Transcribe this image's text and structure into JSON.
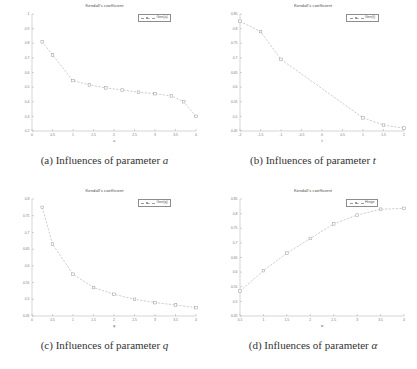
{
  "figure": {
    "panels": [
      {
        "id": "a",
        "caption_prefix": "(a) Influences of parameter",
        "caption_param": "a",
        "title": "Kendall's coefficient",
        "legend_label": "Gen(a)"
      },
      {
        "id": "b",
        "caption_prefix": "(b) Influences of parameter",
        "caption_param": "t",
        "title": "Kendall's coefficient",
        "legend_label": "Gen(t)"
      },
      {
        "id": "c",
        "caption_prefix": "(c) Influences of parameter",
        "caption_param": "q",
        "title": "Kendall's coefficient",
        "legend_label": "Gen(q)"
      },
      {
        "id": "d",
        "caption_prefix": "(d) Influences of parameter",
        "caption_param": "α",
        "title": "Kendall's coefficient",
        "legend_label": "Hinge"
      }
    ]
  },
  "chart_data": [
    {
      "type": "line",
      "panel": "a",
      "title": "Kendall's coefficient",
      "xlabel": "a",
      "ylabel": "",
      "legend": [
        "Gen(a)"
      ],
      "legend_position": "top-right",
      "grid": false,
      "xlim": [
        0,
        4
      ],
      "ylim": [
        0.2,
        1.0
      ],
      "xticks": [
        0,
        0.5,
        1,
        1.5,
        2,
        2.5,
        3,
        3.5,
        4
      ],
      "yticks": [
        0.2,
        0.3,
        0.4,
        0.5,
        0.6,
        0.7,
        0.8,
        0.9,
        1
      ],
      "x": [
        0.25,
        0.5,
        1.0,
        1.4,
        1.8,
        2.2,
        2.6,
        3.0,
        3.4,
        3.7,
        4.0
      ],
      "values": [
        0.81,
        0.72,
        0.545,
        0.515,
        0.495,
        0.48,
        0.465,
        0.455,
        0.44,
        0.4,
        0.3
      ],
      "marker": "square",
      "line_style": "dashed"
    },
    {
      "type": "line",
      "panel": "b",
      "title": "Kendall's coefficient",
      "xlabel": "t",
      "ylabel": "",
      "legend": [
        "Gen(t)"
      ],
      "legend_position": "top-right",
      "grid": false,
      "xlim": [
        -2,
        2
      ],
      "ylim": [
        0.45,
        0.85
      ],
      "xticks": [
        -2,
        -1.5,
        -1,
        -0.5,
        0,
        0.5,
        1,
        1.5,
        2
      ],
      "yticks": [
        0.45,
        0.5,
        0.55,
        0.6,
        0.65,
        0.7,
        0.75,
        0.8,
        0.85
      ],
      "x": [
        -2.0,
        -1.5,
        -1.0,
        1.0,
        1.5,
        2.0
      ],
      "values": [
        0.825,
        0.79,
        0.695,
        0.495,
        0.47,
        0.46
      ],
      "marker": "square",
      "line_style": "dashed"
    },
    {
      "type": "line",
      "panel": "c",
      "title": "Kendall's coefficient",
      "xlabel": "q",
      "ylabel": "",
      "legend": [
        "Gen(q)"
      ],
      "legend_position": "top-right",
      "grid": false,
      "xlim": [
        0,
        4
      ],
      "ylim": [
        0.45,
        0.8
      ],
      "xticks": [
        0,
        0.5,
        1,
        1.5,
        2,
        2.5,
        3,
        3.5,
        4
      ],
      "yticks": [
        0.45,
        0.5,
        0.55,
        0.6,
        0.65,
        0.7,
        0.75,
        0.8
      ],
      "x": [
        0.25,
        0.5,
        1.0,
        1.5,
        2.0,
        2.5,
        3.0,
        3.5,
        4.0
      ],
      "values": [
        0.775,
        0.665,
        0.575,
        0.535,
        0.515,
        0.5,
        0.49,
        0.483,
        0.475
      ],
      "marker": "square",
      "line_style": "dashed"
    },
    {
      "type": "line",
      "panel": "d",
      "title": "Kendall's coefficient",
      "xlabel": "α",
      "ylabel": "",
      "legend": [
        "Hinge"
      ],
      "legend_position": "top-right",
      "grid": false,
      "xlim": [
        0.5,
        4
      ],
      "ylim": [
        0.45,
        0.85
      ],
      "xticks": [
        0.5,
        1,
        1.5,
        2,
        2.5,
        3,
        3.5,
        4
      ],
      "yticks": [
        0.45,
        0.5,
        0.55,
        0.6,
        0.65,
        0.7,
        0.75,
        0.8,
        0.85
      ],
      "x": [
        0.5,
        1.0,
        1.5,
        2.0,
        2.5,
        3.0,
        3.5,
        4.0
      ],
      "values": [
        0.535,
        0.605,
        0.665,
        0.715,
        0.765,
        0.795,
        0.815,
        0.818
      ],
      "marker": "square",
      "line_style": "dashed"
    }
  ]
}
